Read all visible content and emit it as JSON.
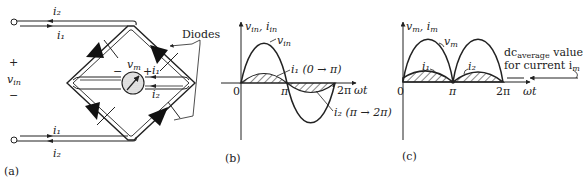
{
  "panel_a": {
    "caption": "(a)",
    "terminal_top_labels": [
      "i₂",
      "i₁"
    ],
    "terminal_bottom_labels": [
      "i₁",
      "i₂"
    ],
    "input_plus": "+",
    "input_label": "v",
    "input_sub": "in",
    "input_minus": "−",
    "meter_label": "v",
    "meter_sub": "m",
    "meter_minus": "−",
    "meter_plus": "+",
    "inner_current_top": "i₁",
    "inner_current_bottom": "i₂",
    "diodes_label": "Diodes"
  },
  "panel_b": {
    "caption": "(b)",
    "y_axis_label": "v",
    "y_axis_sub1": "in",
    "y_axis_sep": ", i",
    "y_axis_sub2": "in",
    "x_axis_label": "ωt",
    "tick_0": "0",
    "tick_pi": "π",
    "tick_2pi": "2π",
    "curve_vin_label": "v",
    "curve_vin_sub": "in",
    "curve_i1_label": "i₁ (0 → π)",
    "curve_i2_label": "i₂ (π → 2π)"
  },
  "panel_c": {
    "caption": "(c)",
    "y_axis_label": "v",
    "y_axis_sub1": "m",
    "y_axis_sep": ", i",
    "y_axis_sub2": "m",
    "x_axis_label": "ωt",
    "tick_0": "0",
    "tick_pi": "π",
    "tick_2pi": "2π",
    "curve_vm_label": "v",
    "curve_vm_sub": "m",
    "curve_i1_label": "i₁",
    "curve_i2_label": "i₂",
    "dc_label_line1_prefix": "dc",
    "dc_label_line1_sub": "average",
    "dc_label_line1_suffix": " value",
    "dc_label_line2": "for current i",
    "dc_label_line2_sub": "m"
  }
}
